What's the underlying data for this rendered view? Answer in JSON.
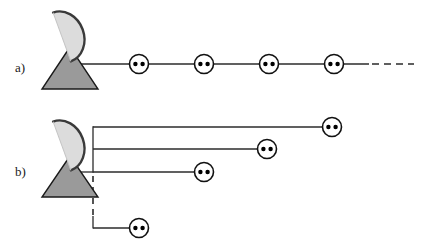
{
  "figure": {
    "width": 421,
    "height": 246,
    "background_color": "#ffffff"
  },
  "colors": {
    "dish_fill": "#dcdcdc",
    "dish_stroke": "#3a3a3a",
    "base_fill": "#9a9a9a",
    "base_stroke": "#1a1a1a",
    "line": "#2b2b2b",
    "node_stroke": "#111111",
    "node_fill": "#ffffff",
    "dot_fill": "#000000",
    "label_text": "#1a1a1a"
  },
  "panels": [
    {
      "id": "panel-a",
      "label": "a)",
      "label_x": 15,
      "label_y": 72,
      "topology": "daisy-chain-bus",
      "antenna": {
        "name": "satellite-dish-a",
        "dish_cx": 62,
        "dish_cy": 37,
        "dish_rx": 22,
        "dish_ry": 26,
        "dish_rotation": -20,
        "base_apex_x": 70,
        "base_apex_y": 47,
        "base_left_x": 42,
        "base_right_x": 98,
        "base_bottom_y": 89
      },
      "trunk": {
        "name": "trunk-line-a",
        "x1": 70,
        "y1": 64,
        "x2": 369,
        "y2": 64,
        "style": "solid"
      },
      "continuation": {
        "name": "continuation-dashes-a",
        "x1": 372,
        "y1": 64,
        "x2": 414,
        "y2": 64,
        "style": "dashed",
        "dash_pattern": "7,5"
      },
      "nodes": [
        {
          "name": "node-a-1",
          "cx": 139,
          "cy": 64
        },
        {
          "name": "node-a-2",
          "cx": 204,
          "cy": 64
        },
        {
          "name": "node-a-3",
          "cx": 269,
          "cy": 64
        },
        {
          "name": "node-a-4",
          "cx": 334,
          "cy": 64
        }
      ]
    },
    {
      "id": "panel-b",
      "label": "b)",
      "label_x": 15,
      "label_y": 176,
      "topology": "star-branch",
      "antenna": {
        "name": "satellite-dish-b",
        "dish_cx": 62,
        "dish_cy": 146,
        "dish_rx": 22,
        "dish_ry": 26,
        "dish_rotation": -20,
        "base_apex_x": 70,
        "base_apex_y": 156,
        "base_left_x": 42,
        "base_right_x": 98,
        "base_bottom_y": 197
      },
      "stub": {
        "name": "dish-stub-line-b",
        "x1": 70,
        "y1": 172,
        "x2": 93,
        "y2": 172,
        "style": "solid"
      },
      "bus": {
        "name": "vertical-bus-b",
        "x": 93,
        "y_top": 127,
        "y_bottom": 172,
        "style": "solid"
      },
      "bus_dashed": {
        "name": "vertical-bus-dashed-b",
        "x": 93,
        "y_top": 176,
        "y_bottom": 216,
        "style": "dashed",
        "dash_pattern": "6,5"
      },
      "bus_tail": {
        "name": "vertical-bus-tail-b",
        "x": 93,
        "y_top": 216,
        "y_bottom": 228,
        "style": "solid"
      },
      "branches": [
        {
          "name": "branch-b-1",
          "x1": 93,
          "y1": 127,
          "x2": 323,
          "y2": 127,
          "style": "solid",
          "node": {
            "name": "node-b-1",
            "cx": 332,
            "cy": 127
          }
        },
        {
          "name": "branch-b-2",
          "x1": 93,
          "y1": 149,
          "x2": 258,
          "y2": 149,
          "style": "solid",
          "node": {
            "name": "node-b-2",
            "cx": 267,
            "cy": 149
          }
        },
        {
          "name": "branch-b-3",
          "x1": 93,
          "y1": 172,
          "x2": 195,
          "y2": 172,
          "style": "solid",
          "node": {
            "name": "node-b-3",
            "cx": 204,
            "cy": 172
          }
        },
        {
          "name": "branch-b-4",
          "x1": 93,
          "y1": 228,
          "x2": 130,
          "y2": 228,
          "style": "solid",
          "node": {
            "name": "node-b-4",
            "cx": 139,
            "cy": 228
          }
        }
      ]
    }
  ],
  "node_style": {
    "radius": 9.5,
    "stroke_width": 1.6,
    "dot_radius": 2.2,
    "dot_offset_x": 3.6,
    "dot_offset_y": 0
  },
  "line_style": {
    "stroke_width": 1.3
  }
}
